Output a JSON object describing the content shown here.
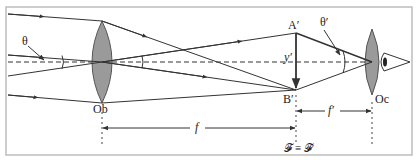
{
  "diagram": {
    "colors": {
      "line": "#333333",
      "lens_fill": "#9a9a9a",
      "border": "#bdbdbd",
      "background": "#ffffff"
    },
    "labels": {
      "theta": "θ",
      "theta_prime": "θ′",
      "a_prime": "A′",
      "b_prime": "B′",
      "y_prime": "y′",
      "objective": "Ob",
      "eyepiece": "Oc",
      "f_objective": "f",
      "f_eyepiece": "f′",
      "focal_equality": "𝓕 ≡ 𝓕′"
    },
    "elements": {
      "objective_lens": "Ob",
      "eyepiece_lens": "Oc",
      "intermediate_image": "A′B′",
      "eye": "eye-icon"
    }
  }
}
